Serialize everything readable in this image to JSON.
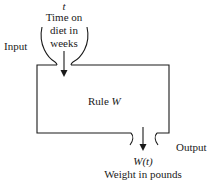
{
  "input": {
    "label": "Input",
    "variable": "t",
    "description_lines": [
      "Time on",
      "diet in",
      "weeks"
    ]
  },
  "rule": {
    "prefix": "Rule ",
    "name": "W"
  },
  "output": {
    "label": "Output",
    "variable": "W(t)",
    "description": "Weight in pounds"
  },
  "colors": {
    "stroke": "#1a1a1a",
    "background": "#ffffff"
  }
}
